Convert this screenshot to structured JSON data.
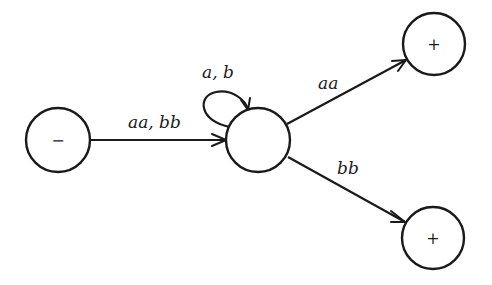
{
  "diagram": {
    "type": "state-transition-graph",
    "nodes": [
      {
        "id": "start",
        "label": "−",
        "role": "start-state"
      },
      {
        "id": "middle",
        "label": "",
        "role": "intermediate-state"
      },
      {
        "id": "final_top",
        "label": "+",
        "role": "final-state"
      },
      {
        "id": "final_bottom",
        "label": "+",
        "role": "final-state"
      }
    ],
    "edges": [
      {
        "from": "start",
        "to": "middle",
        "label": "aa, bb"
      },
      {
        "from": "middle",
        "to": "middle",
        "label": "a, b"
      },
      {
        "from": "middle",
        "to": "final_top",
        "label": "aa"
      },
      {
        "from": "middle",
        "to": "final_bottom",
        "label": "bb"
      }
    ]
  },
  "colors": {
    "ink": "#1a1a1a",
    "background": "#ffffff"
  }
}
